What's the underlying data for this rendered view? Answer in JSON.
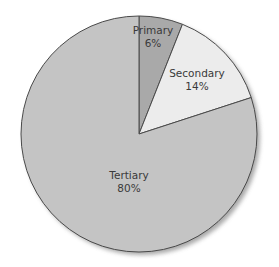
{
  "chart_data": {
    "type": "pie",
    "title": "",
    "categories": [
      "Primary",
      "Secondary",
      "Tertiary"
    ],
    "values": [
      6,
      14,
      80
    ],
    "value_labels": [
      "6%",
      "14%",
      "80%"
    ],
    "colors": [
      "#a9a9a9",
      "#ececec",
      "#c4c4c4"
    ],
    "start_angle_deg": 0,
    "direction": "clockwise",
    "legend": "none",
    "labels_inside": true,
    "shadow": true
  },
  "colors": {
    "edge": "#4a4a4a",
    "shadow": "#9a9a9a",
    "text": "#3a3a3a"
  },
  "labels": {
    "primary": {
      "name": "Primary",
      "pct": "6%"
    },
    "secondary": {
      "name": "Secondary",
      "pct": "14%"
    },
    "tertiary": {
      "name": "Tertiary",
      "pct": "80%"
    }
  }
}
